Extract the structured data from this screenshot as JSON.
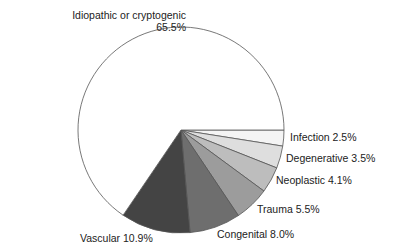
{
  "chart_data": {
    "type": "pie",
    "title": "",
    "start_angle_deg": 0,
    "direction": "clockwise",
    "slices": [
      {
        "label": "Infection",
        "value": 2.5,
        "value_label": "2.5%",
        "color": "#f4f4f4"
      },
      {
        "label": "Degenerative",
        "value": 3.5,
        "value_label": "3.5%",
        "color": "#dedede"
      },
      {
        "label": "Neoplastic",
        "value": 4.1,
        "value_label": "4.1%",
        "color": "#bdbdbd"
      },
      {
        "label": "Trauma",
        "value": 5.5,
        "value_label": "5.5%",
        "color": "#9c9c9c"
      },
      {
        "label": "Congenital",
        "value": 8.0,
        "value_label": "8.0%",
        "color": "#6e6e6e"
      },
      {
        "label": "Vascular",
        "value": 10.9,
        "value_label": "10.9%",
        "color": "#444444"
      },
      {
        "label": "Idiopathic or cryptogenic",
        "value": 65.5,
        "value_label": "65.5%",
        "color": "#ffffff"
      }
    ]
  },
  "labels": {
    "idiopathic_line1": "Idiopathic or cryptogenic",
    "idiopathic_line2": "65.5%",
    "infection": "Infection 2.5%",
    "degenerative": "Degenerative 3.5%",
    "neoplastic": "Neoplastic 4.1%",
    "trauma": "Trauma 5.5%",
    "congenital": "Congenital 8.0%",
    "vascular": "Vascular 10.9%"
  }
}
